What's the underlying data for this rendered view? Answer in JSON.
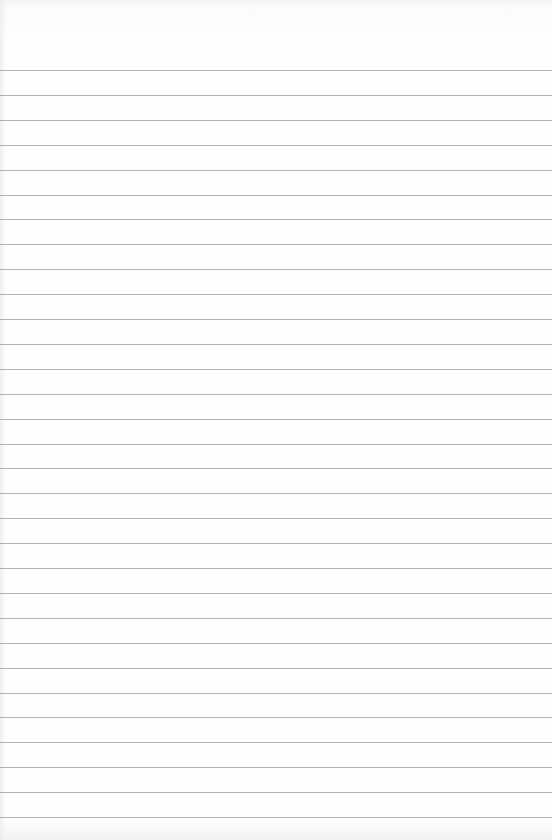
{
  "page": {
    "type": "lined-paper",
    "background_color": "#fefefe",
    "line_color": "#9a9a9a",
    "first_line_y": 70,
    "line_spacing": 24.9,
    "line_count": 31,
    "text": ""
  }
}
